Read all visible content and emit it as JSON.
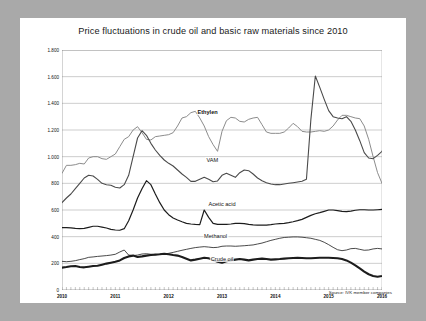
{
  "frame": {
    "border_color": "#a9a9a9",
    "card_color": "#ffffff"
  },
  "chart_title": "Price fluctuations in crude oil and basic raw materials since 2010",
  "source_note": "Source: IVK member companies",
  "axis": {
    "y_ticks": [
      "1.800",
      "1.600",
      "1.400",
      "1.200",
      "1.000",
      "800",
      "600",
      "400",
      "200",
      "0"
    ],
    "x_ticks": [
      "2010",
      "2011",
      "2012",
      "2013",
      "2014",
      "2015",
      "2016"
    ]
  },
  "series_labels": {
    "ethylen": "Ethylen",
    "vam": "VAM",
    "acetic": "Acetic acid",
    "methanol": "Methanol",
    "crude": "Crude oil"
  },
  "chart_data": {
    "type": "line",
    "title": "Price fluctuations in crude oil and basic raw materials since 2010",
    "xlabel": "",
    "ylabel": "",
    "ylim": [
      0,
      1800
    ],
    "xlim": [
      2010.0,
      2016.0
    ],
    "yticks": [
      0,
      200,
      400,
      600,
      800,
      1000,
      1200,
      1400,
      1600,
      1800
    ],
    "ytick_labels": [
      "0",
      "200",
      "400",
      "600",
      "800",
      "1.000",
      "1.200",
      "1.400",
      "1.600",
      "1.800"
    ],
    "xticks": [
      2010,
      2011,
      2012,
      2013,
      2014,
      2015,
      2016
    ],
    "grid": "horizontal",
    "legend": "inline-annotations",
    "x_start": 2010.0,
    "x_step": 0.0833333,
    "series": [
      {
        "name": "Ethylen",
        "color": "#8c8c8c",
        "width": 1.0,
        "values": [
          875,
          935,
          935,
          940,
          950,
          945,
          990,
          1000,
          1000,
          985,
          980,
          1000,
          1020,
          1075,
          1130,
          1150,
          1200,
          1225,
          1180,
          1130,
          1125,
          1150,
          1155,
          1160,
          1165,
          1180,
          1230,
          1290,
          1300,
          1330,
          1340,
          1290,
          1230,
          1150,
          1090,
          1040,
          1190,
          1270,
          1295,
          1290,
          1265,
          1260,
          1280,
          1290,
          1295,
          1240,
          1185,
          1175,
          1175,
          1175,
          1185,
          1215,
          1250,
          1225,
          1190,
          1185,
          1185,
          1190,
          1195,
          1190,
          1200,
          1230,
          1275,
          1310,
          1310,
          1300,
          1290,
          1285,
          1230,
          1130,
          1000,
          880,
          800,
          900,
          1010,
          1060,
          1125,
          1130,
          1080,
          1000,
          940,
          905,
          920,
          915
        ]
      },
      {
        "name": "VAM",
        "color": "#4a4a4a",
        "width": 1.1,
        "values": [
          655,
          690,
          720,
          760,
          800,
          840,
          860,
          855,
          830,
          800,
          790,
          785,
          770,
          765,
          790,
          860,
          1000,
          1140,
          1195,
          1160,
          1100,
          1050,
          1010,
          975,
          950,
          930,
          900,
          870,
          845,
          815,
          815,
          830,
          845,
          830,
          812,
          818,
          860,
          875,
          860,
          845,
          880,
          900,
          895,
          870,
          840,
          820,
          805,
          795,
          790,
          790,
          795,
          800,
          805,
          810,
          815,
          830,
          1280,
          1605,
          1520,
          1430,
          1345,
          1300,
          1290,
          1285,
          1300,
          1265,
          1200,
          1120,
          1030,
          990,
          985,
          1010,
          1040,
          1095,
          1125,
          1120,
          1085,
          1060,
          1090,
          1105,
          1075,
          1060,
          1080,
          1065
        ]
      },
      {
        "name": "Acetic acid",
        "color": "#1c1c1c",
        "width": 1.2,
        "values": [
          468,
          468,
          466,
          462,
          460,
          462,
          470,
          478,
          478,
          472,
          465,
          455,
          450,
          448,
          460,
          520,
          600,
          690,
          760,
          820,
          790,
          720,
          655,
          600,
          565,
          540,
          525,
          512,
          500,
          495,
          492,
          490,
          600,
          545,
          500,
          492,
          492,
          492,
          495,
          500,
          500,
          498,
          492,
          488,
          486,
          486,
          486,
          490,
          495,
          498,
          500,
          505,
          512,
          520,
          530,
          545,
          560,
          572,
          580,
          590,
          600,
          600,
          595,
          590,
          588,
          592,
          598,
          602,
          602,
          600,
          600,
          602,
          604,
          605,
          605,
          604,
          602,
          600,
          598,
          595,
          590,
          580,
          568,
          558
        ]
      },
      {
        "name": "Methanol",
        "color": "#1c1c1c",
        "width": 0.8,
        "values": [
          215,
          212,
          215,
          220,
          228,
          235,
          245,
          248,
          252,
          255,
          258,
          262,
          268,
          285,
          300,
          262,
          258,
          262,
          270,
          272,
          268,
          265,
          268,
          270,
          275,
          282,
          290,
          298,
          305,
          312,
          318,
          322,
          325,
          322,
          318,
          320,
          328,
          330,
          330,
          328,
          330,
          332,
          335,
          338,
          345,
          352,
          362,
          372,
          380,
          388,
          394,
          396,
          398,
          398,
          396,
          392,
          388,
          380,
          372,
          358,
          340,
          320,
          302,
          295,
          300,
          310,
          312,
          305,
          298,
          300,
          308,
          312,
          308,
          300,
          292,
          282,
          272,
          262,
          252,
          240,
          228,
          215,
          200,
          192
        ]
      },
      {
        "name": "Crude oil",
        "color": "#1c1c1c",
        "width": 2.1,
        "values": [
          168,
          172,
          178,
          180,
          172,
          170,
          175,
          180,
          182,
          190,
          198,
          205,
          212,
          222,
          240,
          252,
          258,
          248,
          252,
          258,
          262,
          265,
          268,
          272,
          268,
          262,
          258,
          248,
          235,
          222,
          228,
          235,
          242,
          238,
          225,
          212,
          205,
          215,
          222,
          228,
          232,
          228,
          222,
          228,
          232,
          235,
          232,
          228,
          230,
          232,
          235,
          238,
          240,
          242,
          240,
          238,
          238,
          240,
          242,
          242,
          242,
          240,
          238,
          232,
          222,
          205,
          185,
          162,
          138,
          118,
          105,
          100,
          105,
          112,
          118,
          120,
          115,
          108,
          100,
          92,
          82,
          70,
          60,
          52
        ]
      }
    ]
  },
  "annotations": [
    {
      "label": "Ethylen",
      "x_pct": 45.5,
      "y_pct": 26.0,
      "bold": true
    },
    {
      "label": "VAM",
      "x_pct": 47.0,
      "y_pct": 45.8,
      "bold": false
    },
    {
      "label": "Acetic acid",
      "x_pct": 50.0,
      "y_pct": 64.3,
      "bold": false
    },
    {
      "label": "Methanol",
      "x_pct": 48.0,
      "y_pct": 77.3,
      "bold": false
    },
    {
      "label": "Crude oil",
      "x_pct": 50.0,
      "y_pct": 87.2,
      "bold": false
    }
  ]
}
